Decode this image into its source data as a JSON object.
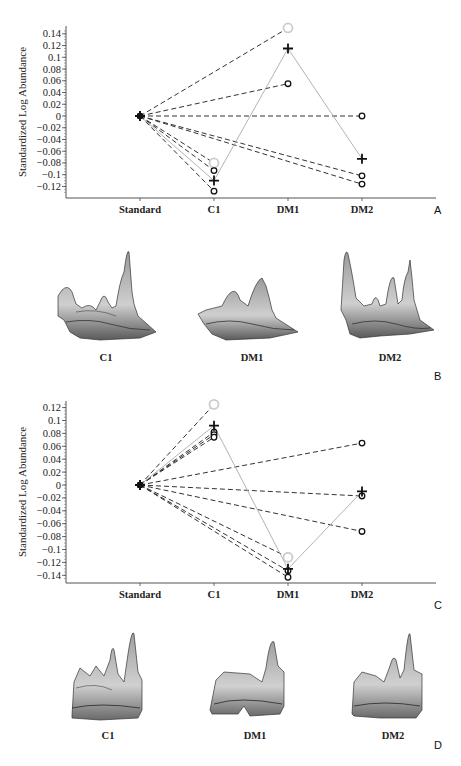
{
  "figure": {
    "panels": [
      "A",
      "B",
      "C",
      "D"
    ],
    "colors": {
      "dashed_line": "#333333",
      "solid_line": "#aaaaaa",
      "marker_dark": "#111111",
      "marker_light": "#cccccc",
      "axis": "#555555"
    }
  },
  "chart_data": [
    {
      "panel": "A",
      "type": "line",
      "title": "",
      "xlabel": "",
      "ylabel": "Standardized Log Abundance",
      "categories": [
        "Standard",
        "C1",
        "DM1",
        "DM2"
      ],
      "yticks": [
        "0.14",
        "0.12",
        "0.1",
        "0.08",
        "0.06",
        "0.04",
        "0.02",
        "0",
        "-0.02",
        "-0.04",
        "-0.06",
        "-0.08",
        "-0.1",
        "-0.12"
      ],
      "ylim": [
        -0.135,
        0.15
      ],
      "grid": false,
      "legend": null,
      "series": [
        {
          "name": "spot-1 (light circle)",
          "style": "dashed",
          "marker": "light-circle",
          "points": [
            [
              "Standard",
              0
            ],
            [
              "DM1",
              0.15
            ]
          ]
        },
        {
          "name": "spot-2 (circle)",
          "style": "dashed",
          "marker": "circle",
          "points": [
            [
              "Standard",
              0
            ],
            [
              "DM1",
              0.055
            ]
          ]
        },
        {
          "name": "spot-3 (circle)",
          "style": "dashed",
          "marker": "circle",
          "points": [
            [
              "Standard",
              0
            ],
            [
              "DM2",
              0.0
            ]
          ]
        },
        {
          "name": "spot-4 (circle)",
          "style": "dashed",
          "marker": "circle",
          "points": [
            [
              "Standard",
              0
            ],
            [
              "DM2",
              -0.102
            ]
          ]
        },
        {
          "name": "spot-5 (circle)",
          "style": "dashed",
          "marker": "circle",
          "points": [
            [
              "Standard",
              0
            ],
            [
              "DM2",
              -0.116
            ]
          ]
        },
        {
          "name": "spot-6 (light circle)",
          "style": "dashed",
          "marker": "light-circle",
          "points": [
            [
              "Standard",
              0
            ],
            [
              "C1",
              -0.08
            ]
          ]
        },
        {
          "name": "spot-7 (circle)",
          "style": "dashed",
          "marker": "circle",
          "points": [
            [
              "Standard",
              0
            ],
            [
              "C1",
              -0.093
            ]
          ]
        },
        {
          "name": "spot-8 (circle)",
          "style": "dashed",
          "marker": "circle",
          "points": [
            [
              "Standard",
              0
            ],
            [
              "C1",
              -0.128
            ]
          ]
        },
        {
          "name": "mean (plus)",
          "style": "solid",
          "marker": "plus",
          "points": [
            [
              "Standard",
              0
            ],
            [
              "C1",
              -0.11
            ],
            [
              "DM1",
              0.115
            ],
            [
              "DM2",
              -0.073
            ]
          ]
        }
      ]
    },
    {
      "panel": "C",
      "type": "line",
      "title": "",
      "xlabel": "",
      "ylabel": "Standardized Log Abundance",
      "categories": [
        "Standard",
        "C1",
        "DM1",
        "DM2"
      ],
      "yticks": [
        "0.12",
        "0.1",
        "0.08",
        "0.06",
        "0.04",
        "0.02",
        "0",
        "-0.02",
        "-0.04",
        "-0.06",
        "-0.08",
        "-0.1",
        "-0.12",
        "-0.14"
      ],
      "ylim": [
        -0.15,
        0.13
      ],
      "grid": false,
      "legend": null,
      "series": [
        {
          "name": "spot-1 (light circle)",
          "style": "dashed",
          "marker": "light-circle",
          "points": [
            [
              "Standard",
              0
            ],
            [
              "C1",
              0.125
            ]
          ]
        },
        {
          "name": "spot-2 (circle)",
          "style": "dashed",
          "marker": "circle",
          "points": [
            [
              "Standard",
              0
            ],
            [
              "C1",
              0.082
            ]
          ]
        },
        {
          "name": "spot-3 (circle)",
          "style": "dashed",
          "marker": "circle",
          "points": [
            [
              "Standard",
              0
            ],
            [
              "C1",
              0.078
            ]
          ]
        },
        {
          "name": "spot-4 (circle)",
          "style": "dashed",
          "marker": "circle",
          "points": [
            [
              "Standard",
              0
            ],
            [
              "C1",
              0.074
            ]
          ]
        },
        {
          "name": "spot-5 (circle)",
          "style": "dashed",
          "marker": "circle",
          "points": [
            [
              "Standard",
              0
            ],
            [
              "DM2",
              0.065
            ]
          ]
        },
        {
          "name": "spot-6 (circle)",
          "style": "dashed",
          "marker": "circle",
          "points": [
            [
              "Standard",
              0
            ],
            [
              "DM2",
              -0.017
            ]
          ]
        },
        {
          "name": "spot-7 (circle)",
          "style": "dashed",
          "marker": "circle",
          "points": [
            [
              "Standard",
              0
            ],
            [
              "DM2",
              -0.072
            ]
          ]
        },
        {
          "name": "spot-8 (light circle)",
          "style": "dashed",
          "marker": "light-circle",
          "points": [
            [
              "Standard",
              0
            ],
            [
              "DM1",
              -0.112
            ]
          ]
        },
        {
          "name": "spot-9 (circle)",
          "style": "dashed",
          "marker": "circle",
          "points": [
            [
              "Standard",
              0
            ],
            [
              "DM1",
              -0.133
            ]
          ]
        },
        {
          "name": "spot-10 (circle)",
          "style": "dashed",
          "marker": "circle",
          "points": [
            [
              "Standard",
              0
            ],
            [
              "DM1",
              -0.143
            ]
          ]
        },
        {
          "name": "mean (plus)",
          "style": "solid",
          "marker": "plus",
          "points": [
            [
              "Standard",
              0
            ],
            [
              "C1",
              0.092
            ],
            [
              "DM1",
              -0.13
            ],
            [
              "DM2",
              -0.01
            ]
          ]
        }
      ]
    },
    {
      "panel": "B",
      "type": "image",
      "title": "3D protein spot views",
      "labels": [
        "C1",
        "DM1",
        "DM2"
      ]
    },
    {
      "panel": "D",
      "type": "image",
      "title": "3D protein spot views",
      "labels": [
        "C1",
        "DM1",
        "DM2"
      ]
    }
  ],
  "labels": {
    "panel_a": "A",
    "panel_b": "B",
    "panel_c": "C",
    "panel_d": "D",
    "ylabel_a": "Standardized Log Abundance",
    "ylabel_c": "Standardized Log Abundance",
    "b_c1": "C1",
    "b_dm1": "DM1",
    "b_dm2": "DM2",
    "d_c1": "C1",
    "d_dm1": "DM1",
    "d_dm2": "DM2"
  }
}
